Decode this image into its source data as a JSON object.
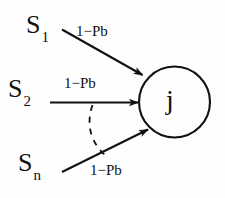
{
  "diagram": {
    "type": "node-edge-diagram",
    "background_color": "#fefefe",
    "stroke_color": "#111111",
    "sources": [
      {
        "id": "s1",
        "label": "S",
        "subscript": "1"
      },
      {
        "id": "s2",
        "label": "S",
        "subscript": "2"
      },
      {
        "id": "sn",
        "label": "S",
        "subscript": "n"
      }
    ],
    "edges": [
      {
        "id": "edge-1",
        "from": "s1",
        "to": "j",
        "label": "1−Pb",
        "style": "solid-arrow"
      },
      {
        "id": "edge-2",
        "from": "s2",
        "to": "j",
        "label": "1−Pb",
        "style": "solid-arrow"
      },
      {
        "id": "edge-3",
        "from": "sn",
        "to": "j",
        "label": "1−Pb",
        "style": "solid-arrow"
      }
    ],
    "ellipsis_arc": {
      "style": "dashed",
      "meaning": "omitted-intermediate-sources"
    },
    "target_node": {
      "id": "j",
      "label": "j",
      "shape": "circle"
    }
  }
}
